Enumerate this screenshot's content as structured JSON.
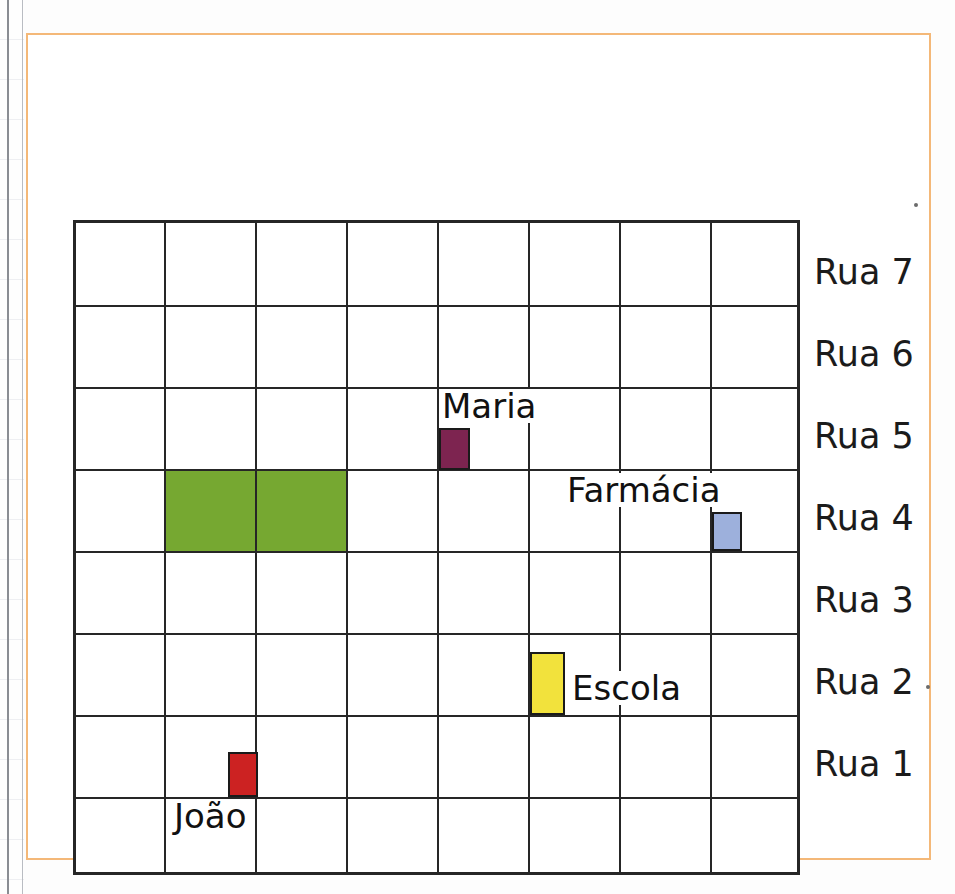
{
  "diagram": {
    "title_visible": false,
    "kind": "neighborhood-street-grid-map",
    "frame_color": "#f4b878",
    "grid": {
      "columns": 8,
      "rows": 8,
      "line_color": "#262626"
    },
    "column_labels": [
      "Rua A",
      "Rua B",
      "Rua C",
      "Rua D",
      "Rua E",
      "Rua F",
      "Rua G"
    ],
    "row_labels": [
      "Rua 7",
      "Rua 6",
      "Rua 5",
      "Rua 4",
      "Rua 3",
      "Rua 2",
      "Rua 1"
    ],
    "places": [
      {
        "name": "Maria",
        "color": "#7d2450",
        "border": "#1a1a1a",
        "street_vertical": "Rua D",
        "street_horizontal": "Rua 5",
        "label_position": "above"
      },
      {
        "name": "Farmácia",
        "color": "#9db0dc",
        "border": "#1a1a1a",
        "street_vertical": "Rua G",
        "street_horizontal": "Rua 4",
        "label_position": "above-left"
      },
      {
        "name": "Escola",
        "color": "#f2e23c",
        "border": "#1a1a1a",
        "street_vertical": "Rua E",
        "street_horizontal": "Rua 2",
        "label_position": "right"
      },
      {
        "name": "João",
        "color": "#cc2222",
        "border": "#1a1a1a",
        "street_vertical": "Rua B",
        "street_horizontal": "Rua 1",
        "label_position": "below-left"
      }
    ],
    "park": {
      "name": "green-area",
      "color": "#76a831",
      "spans_columns": [
        "Rua A",
        "Rua B",
        "Rua C"
      ],
      "between_rows": [
        "Rua 4",
        "Rua 5"
      ]
    }
  }
}
